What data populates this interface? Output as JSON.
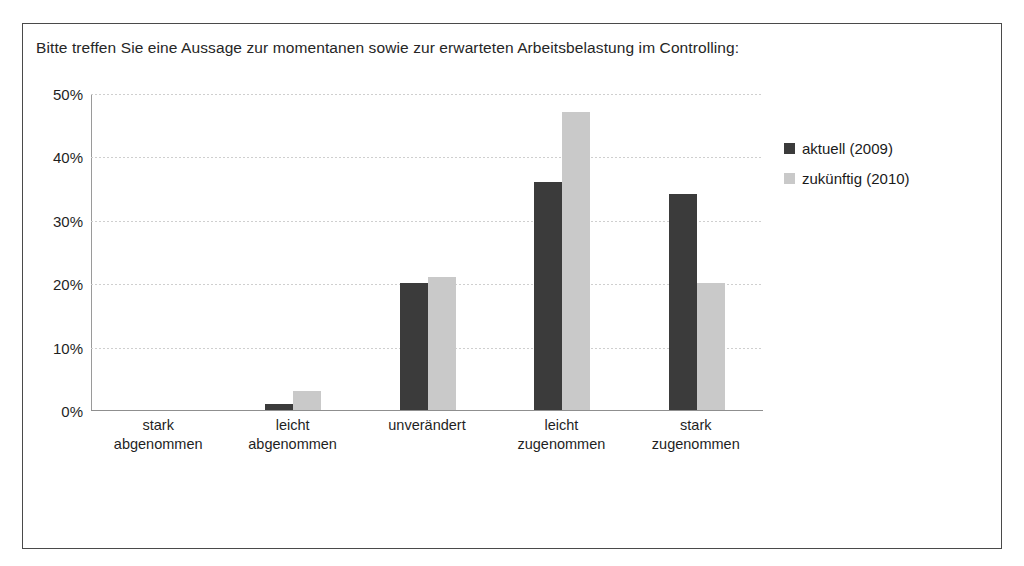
{
  "chart_data": {
    "type": "bar",
    "title": "Bitte treffen Sie eine Aussage zur momentanen sowie zur erwarteten Arbeitsbelastung im Controlling:",
    "categories": [
      "stark abgenommen",
      "leicht abgenommen",
      "unverändert",
      "leicht zugenommen",
      "stark zugenommen"
    ],
    "category_lines": [
      [
        "stark",
        "abgenommen"
      ],
      [
        "leicht",
        "abgenommen"
      ],
      [
        "unverändert",
        ""
      ],
      [
        "leicht",
        "zugenommen"
      ],
      [
        "stark",
        "zugenommen"
      ]
    ],
    "series": [
      {
        "name": "aktuell (2009)",
        "color": "#3b3b3b",
        "values": [
          0,
          1,
          20,
          36,
          34
        ]
      },
      {
        "name": "zukünftig (2010)",
        "color": "#c9c9c9",
        "values": [
          0,
          3,
          21,
          47,
          20
        ]
      }
    ],
    "xlabel": "",
    "ylabel": "",
    "ylim": [
      0,
      50
    ],
    "yticks": [
      0,
      10,
      20,
      30,
      40,
      50
    ],
    "ytick_labels": [
      "0%",
      "10%",
      "20%",
      "30%",
      "40%",
      "50%"
    ],
    "value_suffix": "%",
    "grid": true,
    "grid_axis": "y",
    "legend_position": "right",
    "frame": true,
    "frame_color": "#4a4a4a",
    "background": "#ffffff"
  }
}
